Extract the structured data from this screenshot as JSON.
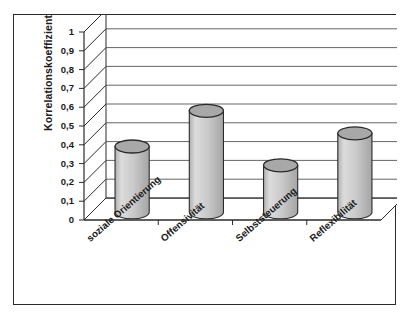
{
  "chart_data": {
    "type": "bar",
    "title": "",
    "subtitle": "",
    "xlabel": "",
    "ylabel": "Korrelationskoeffizient",
    "categories": [
      "soziale Orientierung",
      "Offensivität",
      "Selbststeuerung",
      "Reflexibilität"
    ],
    "values": [
      0.35,
      0.54,
      0.25,
      0.42
    ],
    "series": [
      {
        "name": "Korrelationskoeffizient",
        "values": [
          0.35,
          0.54,
          0.25,
          0.42
        ]
      }
    ],
    "ylim": [
      0,
      1
    ],
    "ytick_step": 0.1,
    "ytick_labels": [
      "0",
      "0,1",
      "0,2",
      "0,3",
      "0,4",
      "0,5",
      "0,6",
      "0,7",
      "0,8",
      "0,9",
      "1"
    ],
    "ytick_values": [
      0,
      0.1,
      0.2,
      0.3,
      0.4,
      0.5,
      0.6,
      0.7,
      0.8,
      0.9,
      1
    ],
    "grid": true,
    "grid_axis": "y",
    "legend": false,
    "legend_position": "none",
    "style": "3d-cylinder",
    "decimal_separator": ",",
    "annotations": []
  },
  "colors": {
    "bar_fill": "#c9c9c9",
    "bar_fill_light": "#dcdcdc",
    "bar_fill_dark": "#b0b0b0",
    "bar_top": "#a8a8a8",
    "bar_outline": "#2b2b2b",
    "grid": "#555555",
    "axis": "#2b2b2b",
    "frame": "#2b2b2b",
    "wall": "#ffffff",
    "floor": "#ffffff",
    "text": "#1a1a1a",
    "page_background": "#ffffff"
  }
}
